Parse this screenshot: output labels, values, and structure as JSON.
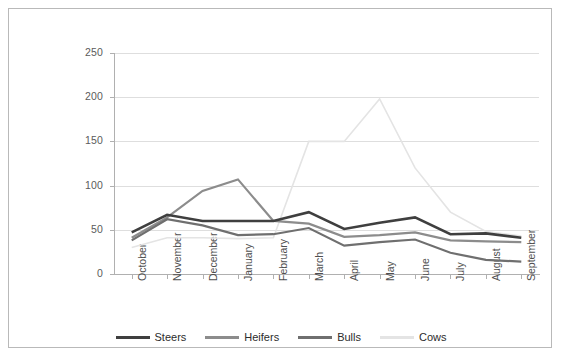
{
  "chart_data": {
    "type": "line",
    "title": "",
    "xlabel": "",
    "ylabel": "Slaughter ('000s)",
    "ylim": [
      0,
      250
    ],
    "yticks": [
      0,
      50,
      100,
      150,
      200,
      250
    ],
    "grid": true,
    "legend_position": "bottom",
    "categories": [
      "October",
      "November",
      "December",
      "January",
      "February",
      "March",
      "April",
      "May",
      "June",
      "July",
      "August",
      "September"
    ],
    "series": [
      {
        "name": "Steers",
        "color": "#3f3f3f",
        "values": [
          47,
          67,
          60,
          60,
          60,
          70,
          51,
          58,
          64,
          45,
          46,
          41
        ]
      },
      {
        "name": "Heifers",
        "color": "#8c8c8c",
        "values": [
          41,
          64,
          94,
          107,
          60,
          57,
          42,
          44,
          47,
          38,
          37,
          36
        ]
      },
      {
        "name": "Bulls",
        "color": "#6f6f6f",
        "values": [
          38,
          62,
          55,
          44,
          45,
          52,
          32,
          36,
          39,
          24,
          16,
          14
        ]
      },
      {
        "name": "Cows",
        "color": "#e4e4e4",
        "values": [
          30,
          41,
          41,
          40,
          41,
          150,
          150,
          198,
          120,
          70,
          48,
          43
        ]
      }
    ]
  },
  "legend": {
    "items": [
      {
        "label": "Steers",
        "color": "#3f3f3f"
      },
      {
        "label": "Heifers",
        "color": "#8c8c8c"
      },
      {
        "label": "Bulls",
        "color": "#6f6f6f"
      },
      {
        "label": "Cows",
        "color": "#e4e4e4"
      }
    ]
  },
  "colors": {
    "frame_border": "#b9b9b9",
    "gridline": "#dedede",
    "axis": "#b0b0b0",
    "tick_text": "#5b5b5b",
    "label_text": "#3a3a3a",
    "background": "#ffffff"
  }
}
